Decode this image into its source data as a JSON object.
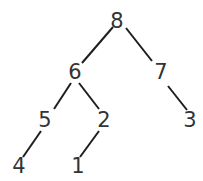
{
  "diagram": {
    "type": "binary-tree",
    "nodes": [
      {
        "id": "n8",
        "label": "8",
        "x": 117,
        "y": 21
      },
      {
        "id": "n6",
        "label": "6",
        "x": 75,
        "y": 72
      },
      {
        "id": "n7",
        "label": "7",
        "x": 161,
        "y": 72
      },
      {
        "id": "n5",
        "label": "5",
        "x": 45,
        "y": 120
      },
      {
        "id": "n2",
        "label": "2",
        "x": 104,
        "y": 120
      },
      {
        "id": "n3",
        "label": "3",
        "x": 190,
        "y": 120
      },
      {
        "id": "n4",
        "label": "4",
        "x": 19,
        "y": 166
      },
      {
        "id": "n1",
        "label": "1",
        "x": 78,
        "y": 166
      }
    ],
    "edges": [
      {
        "from": "8",
        "to": "6",
        "x1": 113,
        "y1": 27,
        "x2": 82,
        "y2": 63
      },
      {
        "from": "8",
        "to": "7",
        "x1": 126,
        "y1": 28,
        "x2": 152,
        "y2": 61
      },
      {
        "from": "6",
        "to": "5",
        "x1": 71,
        "y1": 83,
        "x2": 54,
        "y2": 109
      },
      {
        "from": "6",
        "to": "2",
        "x1": 79,
        "y1": 83,
        "x2": 99,
        "y2": 109
      },
      {
        "from": "7",
        "to": "3",
        "x1": 168,
        "y1": 86,
        "x2": 187,
        "y2": 110
      },
      {
        "from": "5",
        "to": "4",
        "x1": 41,
        "y1": 131,
        "x2": 23,
        "y2": 157
      },
      {
        "from": "2",
        "to": "1",
        "x1": 99,
        "y1": 131,
        "x2": 80,
        "y2": 157
      }
    ],
    "colors": {
      "edge": "#1e1e1e",
      "label": "#333333",
      "background": "#ffffff"
    }
  }
}
